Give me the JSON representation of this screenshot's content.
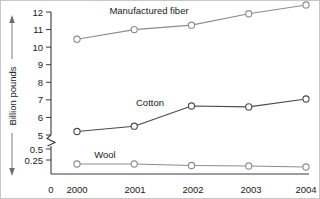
{
  "chart_data": {
    "type": "line",
    "title": "",
    "xlabel": "",
    "ylabel": "Billion pounds",
    "categories": [
      "2000",
      "2001",
      "2002",
      "2003",
      "2004"
    ],
    "x": [
      2000,
      2001,
      2002,
      2003,
      2004
    ],
    "series": [
      {
        "name": "Manufactured fiber",
        "values": [
          10.45,
          11.0,
          11.25,
          11.9,
          12.4
        ],
        "color": "#8c8c8c",
        "marker": "open-circle",
        "label_x": 2001.05,
        "label_y": 12.55
      },
      {
        "name": "Cotton",
        "values": [
          5.2,
          5.5,
          6.65,
          6.6,
          7.05
        ],
        "color": "#4a4a4a",
        "marker": "open-circle",
        "label_x": 2001.35,
        "label_y": 7.0
      },
      {
        "name": "Wool",
        "values": [
          0.2,
          0.2,
          0.17,
          0.16,
          0.14
        ],
        "color": "#8c8c8c",
        "marker": "open-circle",
        "label_x": 2000.8,
        "label_y": 0.42
      }
    ],
    "yticks_upper": [
      "12",
      "11",
      "10",
      "9",
      "8",
      "7",
      "6",
      "5"
    ],
    "yticks_lower": [
      "0.5",
      "0.25"
    ],
    "origin_label": "0",
    "ylim_upper": [
      5,
      12
    ],
    "ylim_lower": [
      0,
      0.5
    ],
    "axis_break": true,
    "axis_break_between": [
      0.5,
      5
    ],
    "grid": false,
    "legend": "inline-labels",
    "axis_color": "#3a3a3a"
  },
  "axis": {
    "y_title": "Billion pounds",
    "tick_12": "12",
    "tick_11": "11",
    "tick_10": "10",
    "tick_9": "9",
    "tick_8": "8",
    "tick_7": "7",
    "tick_6": "6",
    "tick_5": "5",
    "tick_05": "0.5",
    "tick_025": "0.25",
    "tick_0": "0",
    "x_2000": "2000",
    "x_2001": "2001",
    "x_2002": "2002",
    "x_2003": "2003",
    "x_2004": "2004"
  },
  "labels": {
    "fiber": "Manufactured fiber",
    "cotton": "Cotton",
    "wool": "Wool"
  }
}
